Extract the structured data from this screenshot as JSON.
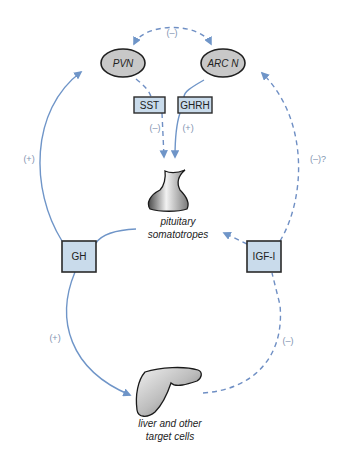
{
  "colors": {
    "arrow_solid": "#6f95c8",
    "arrow_dashed": "#6f8fc4",
    "box_fill": "#c9dbeb",
    "box_stroke": "#2a2a2a",
    "ellipse_fill": "#c8c8c8",
    "ellipse_stroke": "#1f1f1f",
    "sign_text": "#7f93b0"
  },
  "nodes": {
    "pvn": {
      "label": "PVN",
      "shape": "ellipse"
    },
    "arcn": {
      "label": "ARC N",
      "shape": "ellipse"
    },
    "sst": {
      "label": "SST",
      "shape": "box"
    },
    "ghrh": {
      "label": "GHRH",
      "shape": "box"
    },
    "pituitary": {
      "label_line1": "pituitary",
      "label_line2": "somatotropes",
      "shape": "pituitary-gland"
    },
    "gh": {
      "label": "GH",
      "shape": "box"
    },
    "igf1": {
      "label": "IGF-I",
      "shape": "box"
    },
    "liver": {
      "label_line1": "liver and other",
      "label_line2": "target cells",
      "shape": "liver"
    }
  },
  "edges": [
    {
      "from": "pvn",
      "to": "arcn",
      "style": "dashed",
      "bidirectional": true,
      "sign": "(–)"
    },
    {
      "from": "pvn",
      "to": "pituitary",
      "via": "sst",
      "style": "dashed",
      "sign": "(–)"
    },
    {
      "from": "arcn",
      "to": "pituitary",
      "via": "ghrh",
      "style": "solid",
      "sign": "(+)"
    },
    {
      "from": "gh",
      "to": "pvn",
      "style": "solid",
      "sign": "(+)"
    },
    {
      "from": "pituitary",
      "to": "gh",
      "style": "solid",
      "sign": ""
    },
    {
      "from": "gh",
      "to": "liver",
      "style": "solid",
      "sign": "(+)"
    },
    {
      "from": "liver",
      "to": "igf1",
      "style": "dashed",
      "sign": "(–)"
    },
    {
      "from": "igf1",
      "to": "arcn",
      "style": "dashed",
      "sign": "(–)?"
    },
    {
      "from": "igf1",
      "to": "pituitary",
      "style": "dashed",
      "sign": ""
    }
  ],
  "signs": {
    "top": "(–)",
    "sst": "(–)",
    "ghrh": "(+)",
    "gh_to_pvn": "(+)",
    "igf_to_arcn": "(–)?",
    "gh_to_liver": "(+)",
    "liver_to_igf": "(–)"
  }
}
